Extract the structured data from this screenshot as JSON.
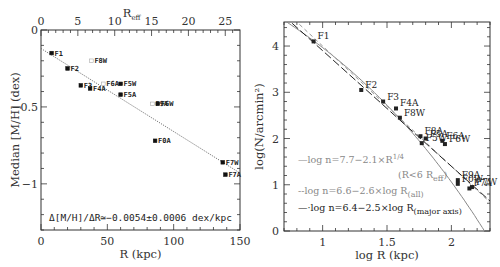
{
  "chart_data": [
    {
      "type": "scatter",
      "title": "",
      "xlabel": "R (kpc)",
      "ylabel": "Median [M/H] (dex)",
      "top_xlabel": "R_eff",
      "xlim": [
        0,
        150
      ],
      "ylim": [
        -1.3,
        0
      ],
      "top_xlim": [
        0,
        27
      ],
      "x_ticks": [
        "0",
        "50",
        "100",
        "150"
      ],
      "y_ticks": [
        "0",
        "-0.5",
        "-1"
      ],
      "top_x_ticks": [
        "0",
        "5",
        "10",
        "15",
        "20",
        "25"
      ],
      "grid": false,
      "points": [
        {
          "label": "F1",
          "x": 8,
          "y": -0.15,
          "filled": true
        },
        {
          "label": "F2",
          "x": 20,
          "y": -0.25,
          "filled": true
        },
        {
          "label": "F8W",
          "x": 38,
          "y": -0.2,
          "filled": false
        },
        {
          "label": "F3",
          "x": 30,
          "y": -0.36,
          "filled": true
        },
        {
          "label": "F4A",
          "x": 37,
          "y": -0.38,
          "filled": true
        },
        {
          "label": "F6A",
          "x": 47,
          "y": -0.35,
          "filled": false
        },
        {
          "label": "F5W",
          "x": 60,
          "y": -0.35,
          "filled": true
        },
        {
          "label": "F5A",
          "x": 60,
          "y": -0.42,
          "filled": true
        },
        {
          "label": "F9A",
          "x": 84,
          "y": -0.48,
          "filled": false
        },
        {
          "label": "F6W",
          "x": 88,
          "y": -0.48,
          "filled": true
        },
        {
          "label": "F0A",
          "x": 86,
          "y": -0.72,
          "filled": true
        },
        {
          "label": "F7W",
          "x": 137,
          "y": -0.86,
          "filled": true
        },
        {
          "label": "F7A",
          "x": 139,
          "y": -0.94,
          "filled": true
        }
      ],
      "fit_line": {
        "intercept": -0.12,
        "slope": -0.0054,
        "style": "dotted"
      },
      "annotation": "Δ[M/H]/ΔR≃−0.0054±0.0006 dex/kpc"
    },
    {
      "type": "scatter",
      "title": "",
      "xlabel": "log R (kpc)",
      "ylabel": "log(N/arcmin²)",
      "xlim": [
        0.7,
        2.3
      ],
      "ylim": [
        0,
        4.52
      ],
      "x_ticks": [
        "1",
        "1.5",
        "2"
      ],
      "y_ticks": [
        "0",
        "1",
        "2",
        "3",
        "4"
      ],
      "grid": false,
      "points": [
        {
          "label": "F1",
          "x": 0.93,
          "y": 4.1
        },
        {
          "label": "F2",
          "x": 1.3,
          "y": 3.05
        },
        {
          "label": "F3",
          "x": 1.47,
          "y": 2.8
        },
        {
          "label": "F4A",
          "x": 1.57,
          "y": 2.65
        },
        {
          "label": "F8W",
          "x": 1.6,
          "y": 2.45
        },
        {
          "label": "F8A",
          "x": 1.76,
          "y": 2.05
        },
        {
          "label": "F5A",
          "x": 1.8,
          "y": 2.0
        },
        {
          "label": "F5W",
          "x": 1.77,
          "y": 1.9
        },
        {
          "label": "F6A",
          "x": 1.93,
          "y": 1.95
        },
        {
          "label": "F6W",
          "x": 1.95,
          "y": 1.88
        },
        {
          "label": "F9A",
          "x": 2.05,
          "y": 1.1
        },
        {
          "label": "F0W",
          "x": 2.05,
          "y": 1.02
        },
        {
          "label": "F7A",
          "x": 2.14,
          "y": 0.92
        },
        {
          "label": "F7W",
          "x": 2.16,
          "y": 0.95
        }
      ],
      "series": [
        {
          "name": "log n=7.7−2.1×R^1/4 (R<6 R_eff)",
          "style": "solid-gray"
        },
        {
          "name": "log n=6.6−2.6×log R(all)",
          "style": "dashed-gray",
          "intercept": 6.6,
          "slope": -2.6
        },
        {
          "name": "log n=6.4−2.5×log R(major axis)",
          "style": "long-dash-black",
          "intercept": 6.4,
          "slope": -2.5
        }
      ]
    }
  ],
  "left_panel": {
    "top_axis_title": "R",
    "top_axis_sub": "eff",
    "x_title": "R (kpc)",
    "y_title": "Median [M/H] (dex)",
    "annotation": "Δ[M/H]/ΔR≃−0.0054±0.0006 dex/kpc",
    "x_ticks": [
      {
        "v": 0,
        "t": "0"
      },
      {
        "v": 50,
        "t": "50"
      },
      {
        "v": 100,
        "t": "100"
      },
      {
        "v": 150,
        "t": "150"
      }
    ],
    "top_ticks": [
      {
        "v": 0,
        "t": "0"
      },
      {
        "v": 5,
        "t": "5"
      },
      {
        "v": 10,
        "t": "10"
      },
      {
        "v": 15,
        "t": "15"
      },
      {
        "v": 20,
        "t": "20"
      },
      {
        "v": 25,
        "t": "25"
      }
    ],
    "y_ticks": [
      {
        "v": 0,
        "t": "0"
      },
      {
        "v": -0.5,
        "t": "−0.5"
      },
      {
        "v": -1,
        "t": "−1"
      }
    ]
  },
  "right_panel": {
    "x_title": "log R (kpc)",
    "y_title": "log(N/arcmin²)",
    "x_ticks": [
      {
        "v": 1,
        "t": "1"
      },
      {
        "v": 1.5,
        "t": "1.5"
      },
      {
        "v": 2,
        "t": "2"
      }
    ],
    "y_ticks": [
      {
        "v": 0,
        "t": "0"
      },
      {
        "v": 1,
        "t": "1"
      },
      {
        "v": 2,
        "t": "2"
      },
      {
        "v": 3,
        "t": "3"
      },
      {
        "v": 4,
        "t": "4"
      }
    ],
    "legend": [
      {
        "text": "—log n=7.7−2.1×R",
        "sup": "1/4",
        "color": "#888888"
      },
      {
        "text": "(R<6 R",
        "sub": "eff",
        "tail": ")",
        "color": "#888888"
      },
      {
        "text": "--log n=6.6−2.6×log R",
        "sub": "(all)",
        "color": "#888888"
      },
      {
        "text": "—·log n=6.4−2.5×log R",
        "sub": "(major axis)",
        "color": "#222222"
      }
    ]
  }
}
